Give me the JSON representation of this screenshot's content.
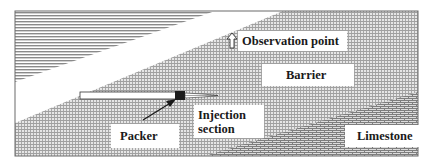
{
  "diagram": {
    "type": "geological cross-section schematic",
    "labels": {
      "observation_point": "Observation point",
      "barrier": "Barrier",
      "injection_section_line1": "Injection",
      "injection_section_line2": "section",
      "packer": "Packer",
      "limestone": "Limestone"
    },
    "icons": {
      "observation_arrow": "up-arrow-outline",
      "packer_pointer": "diagonal-arrow"
    },
    "colors": {
      "frame": "#555555",
      "stripe": "#8a8a8a",
      "hatch": "#9a9a9a",
      "brick": "#8c8c8c",
      "packer": "#1c1c1c",
      "background": "#ffffff"
    }
  }
}
